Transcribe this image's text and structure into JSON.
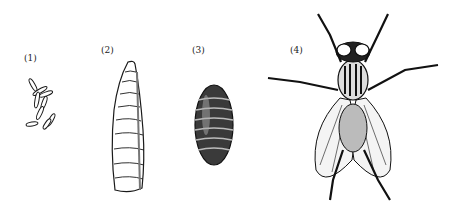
{
  "figure": {
    "labels": [
      "(1)",
      "(2)",
      "(3)",
      "(4)"
    ],
    "stages": [
      "eggs",
      "larva",
      "pupa",
      "adult-fly"
    ],
    "colors": {
      "ink": "#1a1a1a",
      "background": "#ffffff",
      "shade": "#9a9a9a"
    }
  }
}
